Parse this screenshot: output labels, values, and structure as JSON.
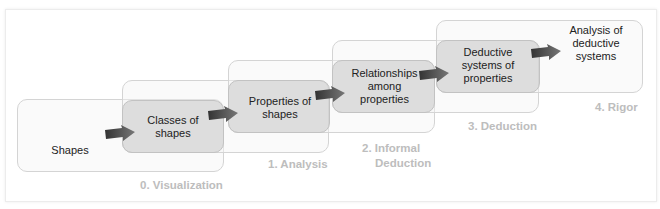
{
  "diagram": {
    "type": "staircase-flow",
    "levels": [
      {
        "label": "0. Visualization",
        "content": "Shapes"
      },
      {
        "label": "1. Analysis",
        "content": "Classes of shapes"
      },
      {
        "label": "2. Informal Deduction",
        "content": "Properties of shapes"
      },
      {
        "label": "3. Deduction",
        "content": "Relationships among properties"
      },
      {
        "label": "4. Rigor",
        "content": "Deductive systems of properties"
      }
    ],
    "final_content": "Analysis of deductive systems",
    "nodes": {
      "n0": "Shapes",
      "n1_l1": "Classes of",
      "n1_l2": "shapes",
      "n2_l1": "Properties of",
      "n2_l2": "shapes",
      "n3_l1": "Relationships",
      "n3_l2": "among",
      "n3_l3": "properties",
      "n4_l1": "Deductive",
      "n4_l2": "systems of",
      "n4_l3": "properties",
      "n5_l1": "Analysis of",
      "n5_l2": "deductive",
      "n5_l3": "systems"
    },
    "labels": {
      "l0": "0. Visualization",
      "l1": "1. Analysis",
      "l2a": "2. Informal",
      "l2b": "Deduction",
      "l3": "3. Deduction",
      "l4": "4. Rigor"
    },
    "colors": {
      "label_gray": "#bdbdbd",
      "box_fill": "#c8c8c8",
      "arrow": "#555555"
    }
  }
}
